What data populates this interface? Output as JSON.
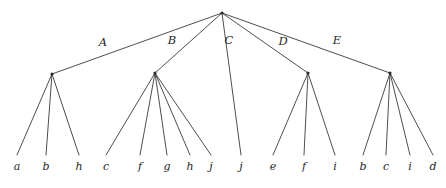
{
  "diagram": {
    "type": "tree",
    "background_color": "#ffffff",
    "line_color": "#3a3a3a",
    "text_color": "#262626",
    "width": 446,
    "height": 188
  },
  "root": {
    "name": "root-node",
    "x": 222,
    "y": 13
  },
  "edge_labels": [
    {
      "label": "A",
      "x": 103,
      "y": 46
    },
    {
      "label": "B",
      "x": 172,
      "y": 44
    },
    {
      "label": "C",
      "x": 229,
      "y": 44
    },
    {
      "label": "D",
      "x": 283,
      "y": 45
    },
    {
      "label": "E",
      "x": 337,
      "y": 44
    }
  ],
  "internal_nodes": [
    {
      "name": "node-a",
      "label": "A",
      "x": 52,
      "y": 74
    },
    {
      "name": "node-b",
      "label": "B",
      "x": 155,
      "y": 73
    },
    {
      "name": "node-d",
      "label": "D",
      "x": 308,
      "y": 73
    },
    {
      "name": "node-e",
      "label": "E",
      "x": 390,
      "y": 73
    }
  ],
  "root_edges": [
    {
      "from": "root",
      "to": "node-a",
      "label": "A",
      "x1": 222,
      "y1": 13,
      "x2": 52,
      "y2": 74
    },
    {
      "from": "root",
      "to": "node-b",
      "label": "B",
      "x1": 222,
      "y1": 13,
      "x2": 155,
      "y2": 73
    },
    {
      "from": "root",
      "to": "leaf-c-1",
      "label": "C",
      "x1": 222,
      "y1": 13,
      "x2": 241,
      "y2": 155
    },
    {
      "from": "root",
      "to": "node-d",
      "label": "D",
      "x1": 222,
      "y1": 13,
      "x2": 308,
      "y2": 73
    },
    {
      "from": "root",
      "to": "node-e",
      "label": "E",
      "x1": 222,
      "y1": 13,
      "x2": 390,
      "y2": 73
    }
  ],
  "leaf_edges": [
    {
      "parent": "node-a",
      "x1": 52,
      "y1": 74,
      "x2": 17,
      "y2": 155
    },
    {
      "parent": "node-a",
      "x1": 52,
      "y1": 74,
      "x2": 46,
      "y2": 155
    },
    {
      "parent": "node-a",
      "x1": 52,
      "y1": 74,
      "x2": 79,
      "y2": 155
    },
    {
      "parent": "node-b",
      "x1": 155,
      "y1": 73,
      "x2": 106,
      "y2": 155
    },
    {
      "parent": "node-b",
      "x1": 155,
      "y1": 73,
      "x2": 140,
      "y2": 155
    },
    {
      "parent": "node-b",
      "x1": 155,
      "y1": 73,
      "x2": 167,
      "y2": 155
    },
    {
      "parent": "node-b",
      "x1": 155,
      "y1": 73,
      "x2": 190,
      "y2": 155
    },
    {
      "parent": "node-b",
      "x1": 155,
      "y1": 73,
      "x2": 211,
      "y2": 155
    },
    {
      "parent": "node-d",
      "x1": 308,
      "y1": 73,
      "x2": 273,
      "y2": 155
    },
    {
      "parent": "node-d",
      "x1": 308,
      "y1": 73,
      "x2": 304,
      "y2": 155
    },
    {
      "parent": "node-d",
      "x1": 308,
      "y1": 73,
      "x2": 335,
      "y2": 155
    },
    {
      "parent": "node-e",
      "x1": 390,
      "y1": 73,
      "x2": 363,
      "y2": 155
    },
    {
      "parent": "node-e",
      "x1": 390,
      "y1": 73,
      "x2": 386,
      "y2": 155
    },
    {
      "parent": "node-e",
      "x1": 390,
      "y1": 73,
      "x2": 410,
      "y2": 155
    },
    {
      "parent": "node-e",
      "x1": 390,
      "y1": 73,
      "x2": 433,
      "y2": 155
    }
  ],
  "leaves": [
    {
      "label": "a",
      "x": 17,
      "y": 170,
      "group": "A"
    },
    {
      "label": "b",
      "x": 46,
      "y": 170,
      "group": "A"
    },
    {
      "label": "h",
      "x": 79,
      "y": 170,
      "group": "A"
    },
    {
      "label": "c",
      "x": 106,
      "y": 170,
      "group": "B"
    },
    {
      "label": "f",
      "x": 140,
      "y": 170,
      "group": "B"
    },
    {
      "label": "g",
      "x": 167,
      "y": 170,
      "group": "B"
    },
    {
      "label": "h",
      "x": 190,
      "y": 170,
      "group": "B"
    },
    {
      "label": "j",
      "x": 211,
      "y": 170,
      "group": "B"
    },
    {
      "label": "j",
      "x": 241,
      "y": 170,
      "group": "C"
    },
    {
      "label": "e",
      "x": 273,
      "y": 170,
      "group": "D"
    },
    {
      "label": "f",
      "x": 304,
      "y": 170,
      "group": "D"
    },
    {
      "label": "i",
      "x": 335,
      "y": 170,
      "group": "D"
    },
    {
      "label": "b",
      "x": 363,
      "y": 170,
      "group": "E"
    },
    {
      "label": "c",
      "x": 386,
      "y": 170,
      "group": "E"
    },
    {
      "label": "i",
      "x": 410,
      "y": 170,
      "group": "E"
    },
    {
      "label": "d",
      "x": 433,
      "y": 170,
      "group": "E"
    }
  ]
}
